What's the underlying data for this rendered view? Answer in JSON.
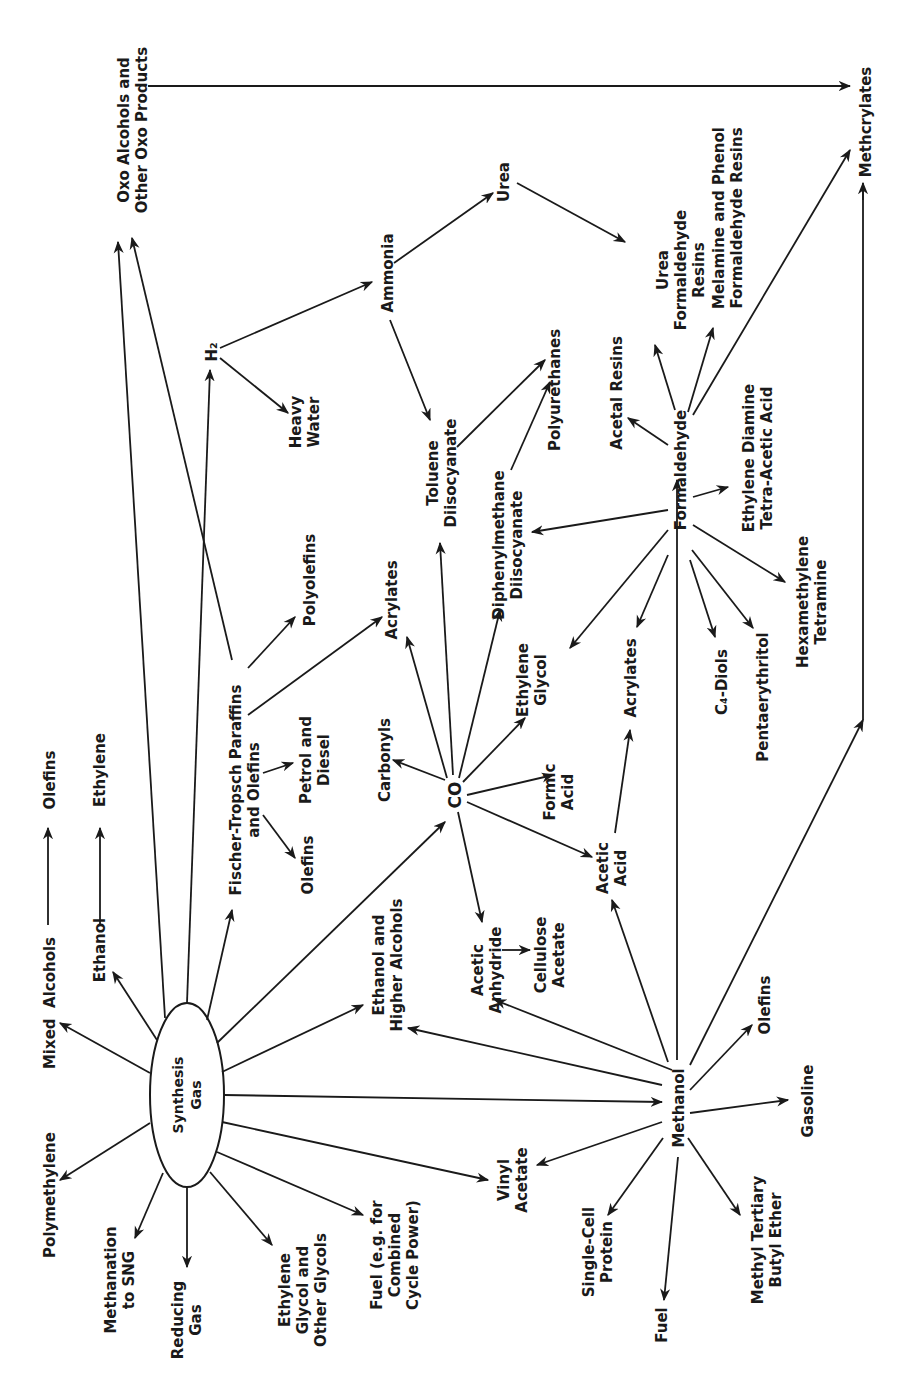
{
  "diagram": {
    "nodes": {
      "synthesis_gas": "Synthesis\nGas",
      "oxo": "Oxo Alcohols and\nOther Oxo Products",
      "methcrylates": "Methcrylates",
      "h2": "H₂",
      "ammonia": "Ammonia",
      "urea": "Urea",
      "heavy_water": "Heavy\nWater",
      "toluene_diisocyanate": "Toluene\nDiisocyanate",
      "polyurethanes": "Polyurethanes",
      "urea_formaldehyde_resins": "Urea\nFormaldehyde\nResins",
      "melamine_phenol": "Melamine and Phenol\nFormaldehyde Resins",
      "acetal_resins": "Acetal Resins",
      "formaldehyde": "Formaldehyde",
      "edta": "Ethylene Diamine\nTetra-Acetic Acid",
      "hexamethylene": "Hexamethylene\nTetramine",
      "pentaerythritol": "Pentaerythritol",
      "c4_diols": "C₄-Diols",
      "acrylates_formaldehyde": "Acrylates",
      "diphenylmethane": "Diphenylmethane\nDiisocyanate",
      "ethylene_glycol_co": "Ethylene\nGlycol",
      "formic_acid": "Formic\nAcid",
      "acetic_acid": "Acetic\nAcid",
      "acrylates_co": "Acrylates",
      "carbonyls": "Carbonyls",
      "co": "CO",
      "polyolefins": "Polyolefins",
      "fischer_tropsch": "Fischer-Tropsch Paraffins\nand Olefins",
      "petrol_diesel": "Petrol and\nDiesel",
      "olefins_ft": "Olefins",
      "mixed_alcohols": "Mixed  Alcohols",
      "olefins_mixed": "Olefins",
      "ethanol": "Ethanol",
      "ethylene": "Ethylene",
      "polymethylene": "Polymethylene",
      "methanation": "Methanation\nto SNG",
      "reducing_gas": "Reducing\nGas",
      "ethylene_glycol_other": "Ethylene\nGlycol and\nOther Glycols",
      "fuel_combined": "Fuel (e.g. for\nCombined\nCycle Power)",
      "ethanol_higher": "Ethanol and\nHigher Alcohols",
      "acetic_anhydride": "Acetic\nAnhydride",
      "cellulose_acetate": "Cellulose\nAcetate",
      "vinyl_acetate": "Vinyl\nAcetate",
      "methanol": "Methanol",
      "olefins_methanol": "Olefins",
      "gasoline": "Gasoline",
      "single_cell_protein": "Single-Cell\nProtein",
      "fuel_methanol": "Fuel",
      "mtbe": "Methyl Tertiary\nButyl Ether"
    }
  }
}
